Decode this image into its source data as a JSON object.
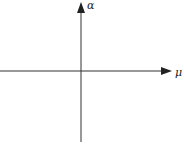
{
  "diagram": {
    "type": "coordinate-axes",
    "x_axis": {
      "label": "μ"
    },
    "y_axis": {
      "label": "α"
    },
    "line_color": "#333333"
  }
}
